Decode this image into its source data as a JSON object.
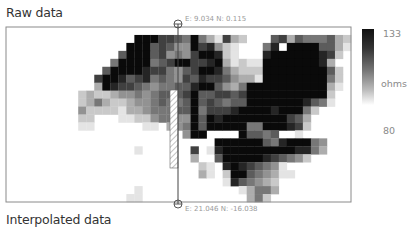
{
  "titles": {
    "raw": "Raw data",
    "interpolated": "Interpolated data"
  },
  "transect": {
    "start_label": "E: 9.034  N: 0.115",
    "end_label": "E: 21.046  N: -16.038"
  },
  "colorbar": {
    "max_label": "133",
    "min_label": "80",
    "unit_label": "ohms",
    "max": 133,
    "min": 80
  },
  "chart_data": {
    "type": "heatmap",
    "title": "Raw data",
    "value_unit": "ohms",
    "value_range": [
      80,
      133
    ],
    "colormap": "white-to-black",
    "columns": 43,
    "rows": 22,
    "transect": {
      "start": {
        "E": 9.034,
        "N": 0.115
      },
      "end": {
        "E": 21.046,
        "N": -16.038
      },
      "column": 21
    },
    "grid_levels_note": "values 0-9, 0 = no data/80 ohms (white), 9 = 133 ohms (black)",
    "grid": [
      "0000000000000000000000000000000000000000000",
      "0000000000000000999776595317320006736555632",
      "0000000000000009996764497842100058099996631",
      "0000000000000069996745479982100089999998720",
      "0000000000000599995679977893121199999998300",
      "0000000000006999987754679985322299999999620",
      "0000000000079986785654768776433199999999520",
      "0000000000039877654556689964359999999999310",
      "0000000002322344545666796677679999999999200",
      "0000000002353223445655696765669999999865100",
      "0000000004222213345556695777899998999520000",
      "0000000002200011224554496989999999976300000",
      "0000000001100000011034596999995599987200000",
      "0000000000000000000000499000096656001000000",
      "0000000000000000000000000099999965899954000",
      "0000000000000000100000070189999999998853000",
      "0000000000000000000000030069999987654200000",
      "0000000000000000000000002108987654100000000",
      "0000000000000000000000003102996543110000000",
      "0000000000000000000000000001865432000000000",
      "0000000000000000100000000000013553000000000",
      "0000000000000001100000000000003520000000000"
    ]
  }
}
